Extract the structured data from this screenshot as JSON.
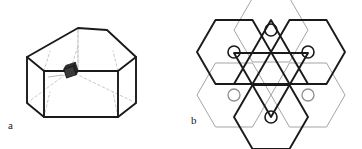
{
  "figure": {
    "panels": [
      {
        "id": "a",
        "label": "a",
        "caption_position": "bottom-left",
        "description": "pentagonal-prism-with-marker"
      },
      {
        "id": "b",
        "label": "b",
        "caption_position": "bottom-left",
        "description": "overlapping-hexagon-star-tiling-with-circles"
      }
    ],
    "colors": {
      "stroke_bold": "#1a1a1a",
      "stroke_light": "#9a9a9a",
      "stroke_dashed": "#aaaaaa",
      "marker_fill": "#3a3a3a",
      "background": "#ffffff"
    },
    "line_weights": {
      "bold": 2.0,
      "medium": 1.2,
      "light": 0.7,
      "dashed": 0.7
    },
    "panel_a": {
      "solid_outline": [
        [
          27,
          57
        ],
        [
          27,
          103
        ],
        [
          44,
          117
        ],
        [
          118,
          117
        ],
        [
          136,
          103
        ],
        [
          136,
          57
        ],
        [
          107,
          30
        ],
        [
          78,
          28
        ]
      ],
      "front_face": [
        [
          44,
          71
        ],
        [
          44,
          117
        ],
        [
          118,
          117
        ],
        [
          118,
          71
        ]
      ],
      "apex": [
        78,
        28
      ],
      "marker": {
        "center": [
          70,
          72
        ],
        "size": 9,
        "rotation_deg": -18,
        "fill": "#3a3a3a"
      },
      "hidden_edges": "dashed-interior-diagonals"
    },
    "panel_b": {
      "hexagon_radius": 37,
      "hexagon_orientation": "flat-top",
      "hexagons": [
        {
          "center": [
            271,
            30
          ],
          "weight": "light",
          "circle": true
        },
        {
          "center": [
            234,
            52
          ],
          "weight": "bold",
          "circle": true
        },
        {
          "center": [
            308,
            52
          ],
          "weight": "bold",
          "circle": true
        },
        {
          "center": [
            234,
            95
          ],
          "weight": "light",
          "circle": true
        },
        {
          "center": [
            308,
            95
          ],
          "weight": "light",
          "circle": true
        },
        {
          "center": [
            271,
            117
          ],
          "weight": "bold",
          "circle": true
        }
      ],
      "circle_radius": 6,
      "circle_count": 6,
      "central_triangles": {
        "up": {
          "weight": "bold"
        },
        "down": {
          "weight": "bold"
        }
      }
    }
  }
}
